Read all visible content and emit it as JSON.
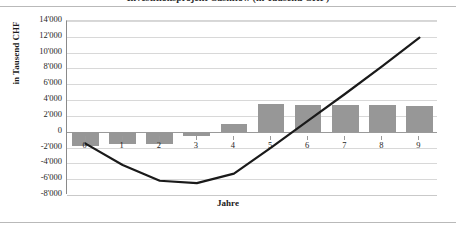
{
  "figure": {
    "title_clipped": "Investitionsprojekt Cashflow (in Tausend CHF)",
    "bar_color": "#979797",
    "line_color": "#1a1a1a",
    "grid_color": "#d8d8d8"
  },
  "chart_data": {
    "type": "bar",
    "title": "Investitionsprojekt Cashflow (in Tausend CHF)",
    "xlabel": "Jahre",
    "ylabel": "in Tausend CHF",
    "categories": [
      "0",
      "1",
      "2",
      "3",
      "4",
      "5",
      "6",
      "7",
      "8",
      "9"
    ],
    "ylim": [
      -8000,
      14000
    ],
    "ytick_values": [
      14000,
      12000,
      10000,
      8000,
      6000,
      4000,
      2000,
      0,
      -2000,
      -4000,
      -6000,
      -8000
    ],
    "ytick_labels": [
      "14'000",
      "12'000",
      "10'000",
      "8'000",
      "6'000",
      "4'000",
      "2'000",
      "0",
      "-2'000",
      "-4'000",
      "-6'000",
      "-8'000"
    ],
    "grid": true,
    "legend": "none",
    "series": [
      {
        "name": "Cashflow pro Jahr",
        "type": "bar",
        "values": [
          -1800,
          -1500,
          -1500,
          -600,
          1000,
          3500,
          3400,
          3400,
          3400,
          3200
        ]
      },
      {
        "name": "Kumulierter Cashflow",
        "type": "line",
        "values": [
          -1500,
          -4200,
          -6200,
          -6500,
          -5300,
          -2000,
          1400,
          4800,
          8300,
          11900
        ]
      }
    ]
  }
}
